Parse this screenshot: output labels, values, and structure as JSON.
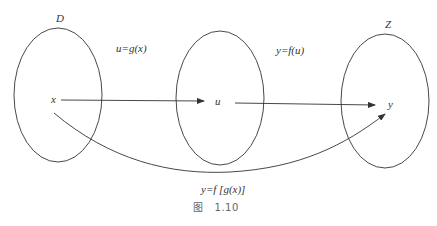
{
  "diagram": {
    "sets": [
      {
        "id": "D",
        "label": "D",
        "cx": 58,
        "cy": 95,
        "rx": 44,
        "ry": 67
      },
      {
        "id": "U",
        "label": "",
        "cx": 220,
        "cy": 98,
        "rx": 44,
        "ry": 67
      },
      {
        "id": "Z",
        "label": "Z",
        "cx": 385,
        "cy": 101,
        "rx": 44,
        "ry": 67
      }
    ],
    "points": {
      "x": "x",
      "u": "u",
      "y": "y"
    },
    "mappings": {
      "g": "u=g(x)",
      "f": "y=f(u)",
      "composite": "y=f [g(x)]"
    },
    "caption": {
      "prefix": "图",
      "number": "1.10"
    },
    "colors": {
      "stroke": "#333333",
      "caption": "#666666"
    }
  }
}
